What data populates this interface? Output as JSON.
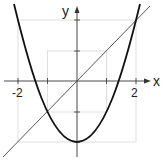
{
  "diagram": {
    "title": "",
    "axes": {
      "x_label": "x",
      "y_label": "y",
      "x_ticks": [
        {
          "value": -2,
          "label": "-2"
        },
        {
          "value": -1,
          "label": ""
        },
        {
          "value": 1,
          "label": ""
        },
        {
          "value": 2,
          "label": "2"
        }
      ],
      "y_ticks": [
        {
          "value": 2,
          "label": ""
        },
        {
          "value": 1,
          "label": ""
        },
        {
          "value": -1,
          "label": ""
        },
        {
          "value": -2,
          "label": ""
        }
      ]
    },
    "curves": [
      {
        "name": "parabola",
        "equation": "y = x^2 - 2",
        "color": "#111111"
      },
      {
        "name": "line",
        "equation": "y = x",
        "color": "#333333"
      }
    ],
    "intersections": [
      {
        "x": -1,
        "y": -1
      },
      {
        "x": 2,
        "y": 2
      }
    ],
    "guide_boxes": [
      {
        "half_width": 1,
        "color": "#d0d0d0"
      },
      {
        "half_width": 2,
        "color": "#d0d0d0"
      }
    ]
  }
}
